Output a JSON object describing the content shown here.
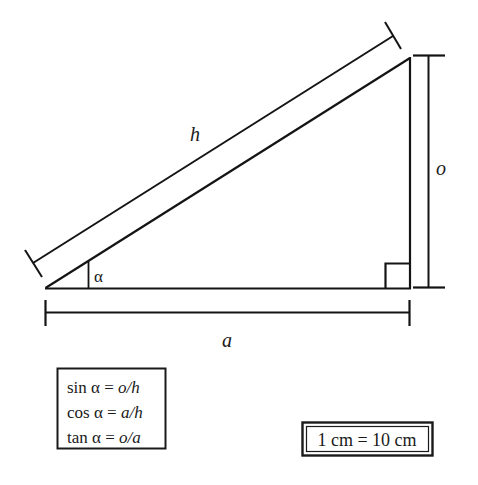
{
  "figure": {
    "title_alt": "Right triangle trigonometry diagram",
    "labels": {
      "hypotenuse": "h",
      "opposite": "o",
      "adjacent": "a",
      "angle": "α"
    },
    "formulas": [
      {
        "fn": "sin",
        "angle": "α",
        "eq": "=",
        "ratio_num": "o",
        "slash": "/",
        "ratio_den": "h"
      },
      {
        "fn": "cos",
        "angle": "α",
        "eq": "=",
        "ratio_num": "a",
        "slash": "/",
        "ratio_den": "h"
      },
      {
        "fn": "tan",
        "angle": "α",
        "eq": "=",
        "ratio_num": "o",
        "slash": "/",
        "ratio_den": "a"
      }
    ],
    "scale_note": "1 cm = 10 cm",
    "colors": {
      "ink": "#141414",
      "background": "#ffffff"
    },
    "geometry": {
      "vertex_left": "45,288",
      "vertex_bottom_right": "410,288",
      "vertex_top_right": "410,58",
      "right_angle_marker": "385,263 to 410,288"
    }
  }
}
